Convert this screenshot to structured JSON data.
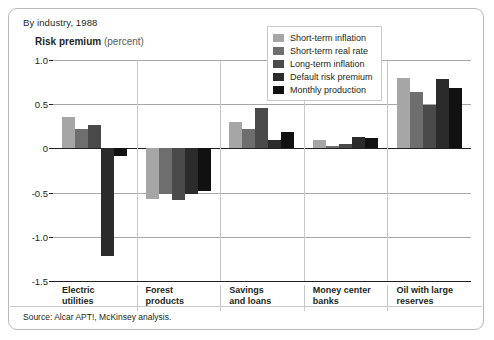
{
  "exhibit": {
    "subtitle": "By industry, 1988",
    "axis_title_strong": "Risk premium",
    "axis_title_light": "(percent)",
    "source": "Source: Alcar APT!, McKinsey analysis."
  },
  "colors": {
    "series": [
      "#a6a6a6",
      "#6e6e6e",
      "#4a4a4a",
      "#2b2b2b",
      "#111111"
    ],
    "axis": "#231f20",
    "grid": "#a7a7a7",
    "separator": "#c8c8c8",
    "border": "#b9b9b9",
    "background": "#ffffff"
  },
  "legend": {
    "position": "top-right",
    "entries": [
      {
        "label": "Short-term inflation",
        "color": "#a6a6a6"
      },
      {
        "label": "Short-term real rate",
        "color": "#6e6e6e"
      },
      {
        "label": "Long-term inflation",
        "color": "#4a4a4a"
      },
      {
        "label": "Default risk premium",
        "color": "#2b2b2b"
      },
      {
        "label": "Monthly production",
        "color": "#111111"
      }
    ]
  },
  "chart_data": {
    "type": "bar",
    "title": "Risk premium (percent)",
    "subtitle": "By industry, 1988",
    "xlabel": "",
    "ylabel": "Risk premium (percent)",
    "ylim": [
      -1.5,
      1.0
    ],
    "yticks": [
      1.0,
      0.5,
      0,
      -0.5,
      -1.0,
      -1.5
    ],
    "ytick_labels": [
      "1.0",
      "0.5",
      "0",
      "-0.5",
      "-1.0",
      "-1.5"
    ],
    "grid": true,
    "legend_position": "top-right",
    "categories": [
      "Electric utilities",
      "Forest products",
      "Savings and loans",
      "Money center banks",
      "Oil with large reserves"
    ],
    "category_lines": [
      [
        "Electric",
        "utilities"
      ],
      [
        "Forest",
        "products"
      ],
      [
        "Savings",
        "and loans"
      ],
      [
        "Money center",
        "banks"
      ],
      [
        "Oil with large",
        "reserves"
      ]
    ],
    "series": [
      {
        "name": "Short-term inflation",
        "color": "#a6a6a6",
        "values": [
          0.35,
          -0.57,
          0.3,
          0.1,
          0.8
        ]
      },
      {
        "name": "Short-term real rate",
        "color": "#6e6e6e",
        "values": [
          0.22,
          -0.52,
          0.22,
          0.03,
          0.64
        ]
      },
      {
        "name": "Long-term inflation",
        "color": "#4a4a4a",
        "values": [
          0.27,
          -0.58,
          0.46,
          0.05,
          0.49
        ]
      },
      {
        "name": "Default risk premium",
        "color": "#2b2b2b",
        "values": [
          -1.22,
          -0.52,
          0.1,
          0.13,
          0.78
        ]
      },
      {
        "name": "Monthly production",
        "color": "#111111",
        "values": [
          -0.09,
          -0.48,
          0.19,
          0.12,
          0.68
        ]
      }
    ],
    "source": "Source: Alcar APT!, McKinsey analysis."
  }
}
